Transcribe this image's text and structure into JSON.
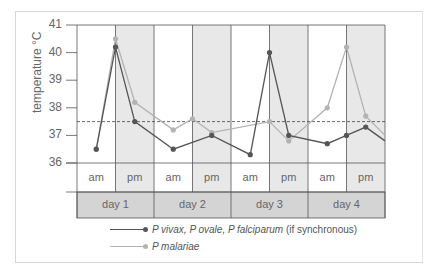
{
  "chart_data": {
    "type": "line",
    "title": "",
    "ylabel": "temperature °C",
    "xlabel": "",
    "ylim": [
      36,
      41
    ],
    "yticks": [
      36,
      37,
      38,
      39,
      40,
      41
    ],
    "grid": false,
    "threshold_line": {
      "value": 37.5,
      "style": "dashed"
    },
    "x_halfday_labels": [
      "am",
      "pm",
      "am",
      "pm",
      "am",
      "pm",
      "am",
      "pm"
    ],
    "x_day_labels": [
      "day 1",
      "day 2",
      "day 3",
      "day 4"
    ],
    "x_positions_note": "x in half-day units from start of day 1 (0..8)",
    "legend_position": "bottom",
    "series": [
      {
        "name": "P vivax, P ovale, P falciparum (if synchronous)",
        "color": "#555555",
        "points": [
          [
            0.5,
            36.5
          ],
          [
            1.0,
            40.2
          ],
          [
            1.5,
            37.5
          ],
          [
            2.5,
            36.5
          ],
          [
            3.5,
            37.0
          ],
          [
            4.5,
            36.3
          ],
          [
            5.0,
            40.0
          ],
          [
            5.5,
            37.0
          ],
          [
            6.5,
            36.7
          ],
          [
            7.0,
            37.0
          ],
          [
            7.5,
            37.3
          ],
          [
            8.0,
            36.8
          ]
        ]
      },
      {
        "name": "P malariae",
        "color": "#b3b3b3",
        "points": [
          [
            0.5,
            36.5
          ],
          [
            1.0,
            40.5
          ],
          [
            1.5,
            38.2
          ],
          [
            2.5,
            37.2
          ],
          [
            3.0,
            37.6
          ],
          [
            3.5,
            37.1
          ],
          [
            5.0,
            37.5
          ],
          [
            5.5,
            36.8
          ],
          [
            6.5,
            38.0
          ],
          [
            7.0,
            40.2
          ],
          [
            7.5,
            37.7
          ],
          [
            8.0,
            37.0
          ]
        ]
      }
    ]
  },
  "axis": {
    "ylabel": "temperature  °C",
    "ticks": [
      "41",
      "40",
      "39",
      "38",
      "37",
      "36"
    ]
  },
  "table": {
    "halfdays": [
      "am",
      "pm",
      "am",
      "pm",
      "am",
      "pm",
      "am",
      "pm"
    ],
    "days": [
      "day 1",
      "day 2",
      "day 3",
      "day 4"
    ]
  },
  "legend": {
    "items": [
      {
        "italic": "P vivax, P ovale, P falciparum",
        "plain": " (if synchronous)",
        "color": "#555555"
      },
      {
        "italic": "P malariae",
        "plain": "",
        "color": "#b3b3b3"
      }
    ]
  },
  "colors": {
    "shade": "#e8e8e8",
    "day_row": "#d4d4d4",
    "grid_line": "#555555",
    "dashed": "#444444"
  }
}
